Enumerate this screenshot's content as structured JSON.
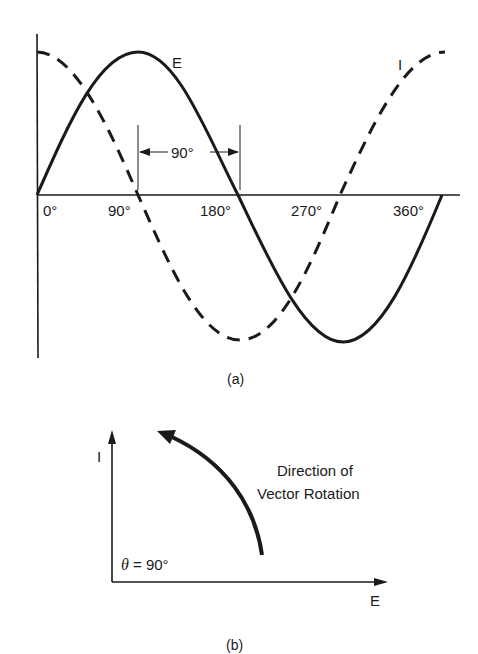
{
  "figure_a": {
    "caption": "(a)",
    "curve_labels": {
      "voltage": "E",
      "current": "I"
    },
    "x_tick_labels": [
      "0°",
      "90°",
      "180°",
      "270°",
      "360°"
    ],
    "phase_marker_label": "90°"
  },
  "figure_b": {
    "caption": "(b)",
    "y_axis_label": "I",
    "x_axis_label": "E",
    "angle_label_symbol": "θ",
    "angle_label_value": "= 90°",
    "rotation_note_line1": "Direction of",
    "rotation_note_line2": "Vector Rotation"
  },
  "colors": {
    "ink": "#1a1a1a",
    "background": "#ffffff"
  }
}
